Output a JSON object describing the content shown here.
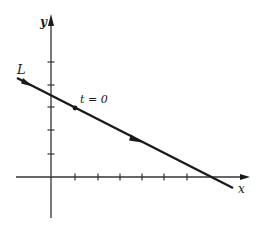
{
  "diagram": {
    "type": "parametric-line-plot",
    "axes": {
      "x_label": "x",
      "y_label": "y",
      "origin_px": [
        51,
        177
      ],
      "x_ticks_px": [
        75,
        98,
        120,
        142,
        164,
        187
      ],
      "y_ticks_px": [
        62,
        85,
        107,
        130,
        154
      ]
    },
    "line": {
      "label": "L",
      "start_px": [
        17,
        78
      ],
      "end_px": [
        233,
        188
      ],
      "direction": "down-right",
      "arrow_positions_px": [
        [
          27,
          84
        ],
        [
          137,
          141
        ]
      ]
    },
    "point": {
      "label": "t = 0",
      "position_px": [
        75,
        108
      ]
    },
    "colors": {
      "ink": "#1a1a1a",
      "axis": "#333333",
      "background": "#ffffff"
    }
  }
}
